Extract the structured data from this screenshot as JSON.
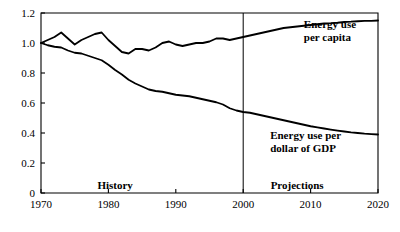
{
  "chart_data": {
    "type": "line",
    "title": "",
    "subtitle": "",
    "xlabel": "",
    "ylabel": "",
    "xlim": [
      1970,
      2020
    ],
    "ylim": [
      0,
      1.2
    ],
    "grid": false,
    "legend_position": "inline-annotation",
    "x_ticks": [
      "1970",
      "1980",
      "1990",
      "2000",
      "2010",
      "2020"
    ],
    "x_tick_values": [
      1970,
      1980,
      1990,
      2000,
      2010,
      2020
    ],
    "y_ticks": [
      "0",
      "0.2",
      "0.4",
      "0.6",
      "0.8",
      "1.0",
      "1.2"
    ],
    "y_tick_values": [
      0,
      0.2,
      0.4,
      0.6,
      0.8,
      1.0,
      1.2
    ],
    "annotations": [
      {
        "text": "History",
        "x": 1981,
        "y": 0.03
      },
      {
        "text": "Projections",
        "x": 2008,
        "y": 0.03
      }
    ],
    "divider": {
      "label": "2000",
      "x": 2000,
      "note": "history / projections boundary"
    },
    "x": [
      1970,
      1971,
      1972,
      1973,
      1974,
      1975,
      1976,
      1977,
      1978,
      1979,
      1980,
      1981,
      1982,
      1983,
      1984,
      1985,
      1986,
      1987,
      1988,
      1989,
      1990,
      1991,
      1992,
      1993,
      1994,
      1995,
      1996,
      1997,
      1998,
      1999,
      2000,
      2001,
      2002,
      2003,
      2004,
      2005,
      2006,
      2007,
      2008,
      2009,
      2010,
      2011,
      2012,
      2013,
      2014,
      2015,
      2016,
      2017,
      2018,
      2019,
      2020
    ],
    "series": [
      {
        "name": "Energy use per capita",
        "label_lines": [
          "Energy use",
          "per capita"
        ],
        "label_x": 2009,
        "label_y": 1.1,
        "color": "#000000",
        "values": [
          1.0,
          1.02,
          1.04,
          1.07,
          1.03,
          0.99,
          1.02,
          1.04,
          1.06,
          1.07,
          1.02,
          0.98,
          0.94,
          0.93,
          0.96,
          0.96,
          0.95,
          0.97,
          1.0,
          1.01,
          0.99,
          0.98,
          0.99,
          1.0,
          1.0,
          1.01,
          1.03,
          1.03,
          1.02,
          1.03,
          1.04,
          1.05,
          1.06,
          1.07,
          1.08,
          1.09,
          1.1,
          1.105,
          1.11,
          1.115,
          1.12,
          1.125,
          1.13,
          1.132,
          1.135,
          1.14,
          1.142,
          1.145,
          1.147,
          1.148,
          1.15
        ]
      },
      {
        "name": "Energy use per dollar of GDP",
        "label_lines": [
          "Energy use per",
          "dollar of GDP"
        ],
        "label_x": 2004,
        "label_y": 0.36,
        "color": "#000000",
        "values": [
          1.0,
          0.985,
          0.975,
          0.97,
          0.95,
          0.935,
          0.93,
          0.915,
          0.9,
          0.885,
          0.855,
          0.82,
          0.79,
          0.755,
          0.73,
          0.71,
          0.69,
          0.68,
          0.675,
          0.665,
          0.655,
          0.65,
          0.645,
          0.635,
          0.625,
          0.615,
          0.605,
          0.59,
          0.565,
          0.55,
          0.54,
          0.535,
          0.525,
          0.515,
          0.505,
          0.495,
          0.485,
          0.475,
          0.465,
          0.455,
          0.445,
          0.437,
          0.43,
          0.423,
          0.416,
          0.41,
          0.404,
          0.4,
          0.396,
          0.393,
          0.39
        ]
      }
    ]
  },
  "geometry": {
    "plot_left": 41,
    "plot_right": 378,
    "plot_top": 13,
    "plot_bottom": 193
  }
}
